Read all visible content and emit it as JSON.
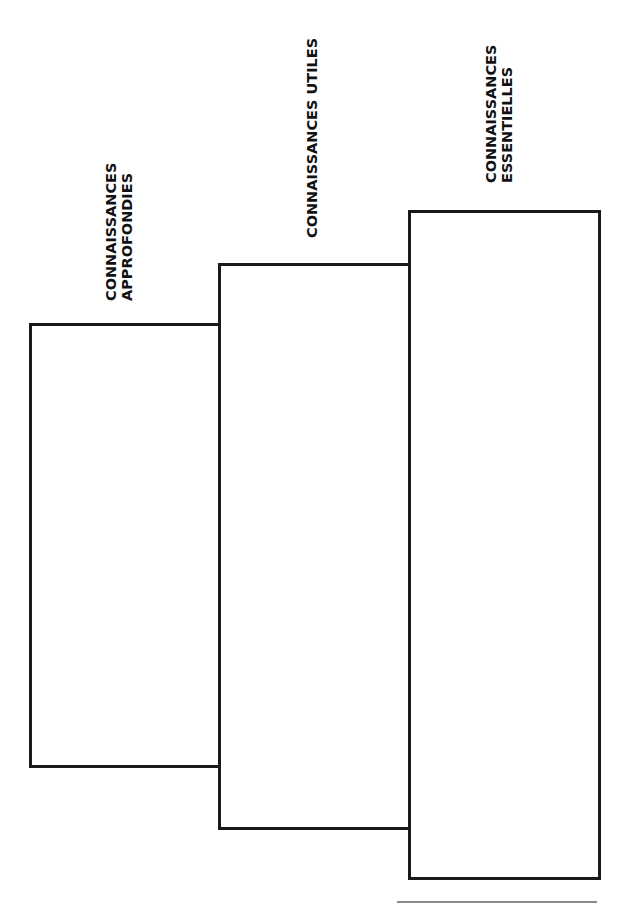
{
  "diagram": {
    "type": "staircase",
    "orientation": "rotated-90",
    "steps": [
      {
        "id": "approfondies",
        "label_lines": [
          "CONNAISSANCES",
          "APPROFONDIES"
        ],
        "box": {
          "x": 29,
          "y": 323,
          "w": 192,
          "h": 445
        }
      },
      {
        "id": "utiles",
        "label_lines": [
          "CONNAISSANCES UTILES"
        ],
        "box": {
          "x": 218,
          "y": 263,
          "w": 193,
          "h": 567
        }
      },
      {
        "id": "essentielles",
        "label_lines": [
          "CONNAISSANCES",
          "ESSENTIELLES"
        ],
        "box": {
          "x": 408,
          "y": 210,
          "w": 193,
          "h": 670
        }
      }
    ],
    "colors": {
      "stroke": "#1a1a1a",
      "text": "#111111",
      "background": "#ffffff",
      "footer_rule": "#8a8a8a"
    }
  }
}
